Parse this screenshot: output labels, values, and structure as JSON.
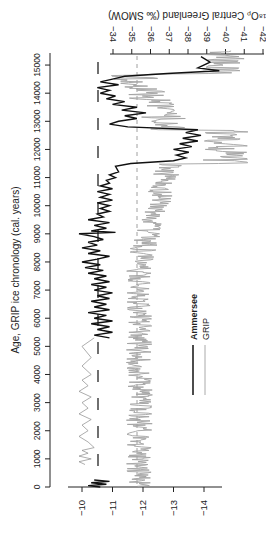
{
  "chart_data": {
    "type": "line",
    "orientation": "rotated-90",
    "title": "",
    "ylabel_age": "Age, GRIP ice chronology (cal. years)",
    "xlabel_bottom": "",
    "xlabel_top": "δ18Op Central Greenland (‰ SMOW)",
    "age_ticks": [
      0,
      1000,
      2000,
      3000,
      4000,
      5000,
      6000,
      7000,
      8000,
      9000,
      10000,
      11000,
      12000,
      13000,
      14000,
      15000
    ],
    "age_tick_labels": [
      "0",
      "1000",
      "2000",
      "3000",
      "4000",
      "5000",
      "6000",
      "7000",
      "8000",
      "9000",
      "10000",
      "11000",
      "12000",
      "13000",
      "14000",
      "15000"
    ],
    "bottom_ticks": [
      -10,
      -11,
      -12,
      -13,
      -14
    ],
    "bottom_tick_labels": [
      "−10",
      "−11",
      "−12",
      "−13",
      "−14"
    ],
    "top_ticks": [
      -34,
      -35,
      -36,
      -37,
      -38,
      -39,
      -40,
      -41,
      -42
    ],
    "top_tick_labels": [
      "−34",
      "−35",
      "−36",
      "−37",
      "−38",
      "−39",
      "−40",
      "−41",
      "−42"
    ],
    "age_range": [
      0,
      15500
    ],
    "bottom_range": [
      -9.6,
      -14.6
    ],
    "top_range": [
      -34,
      -42
    ],
    "legend": [
      {
        "name": "Ammersee",
        "color": "#111111",
        "width": 2
      },
      {
        "name": "GRIP",
        "color": "#999999",
        "width": 1
      }
    ],
    "reference_lines": [
      {
        "axis": "bottom",
        "value": -10.5,
        "style": "long-dash",
        "color": "#111111"
      },
      {
        "axis": "top",
        "value": -35.2,
        "style": "short-dash",
        "color": "#999999"
      }
    ],
    "series": [
      {
        "name": "Ammersee",
        "axis": "bottom",
        "color": "#111111",
        "points": [
          [
            0,
            -10.6
          ],
          [
            50,
            -10.2
          ],
          [
            100,
            -10.8
          ],
          [
            150,
            -10.3
          ],
          [
            200,
            -10.9
          ],
          [
            250,
            -10.4
          ],
          [
            5300,
            -10.9
          ],
          [
            5400,
            -10.4
          ],
          [
            5500,
            -11.0
          ],
          [
            5600,
            -10.5
          ],
          [
            5700,
            -10.9
          ],
          [
            5800,
            -10.3
          ],
          [
            5900,
            -11.0
          ],
          [
            6000,
            -10.4
          ],
          [
            6100,
            -10.8
          ],
          [
            6200,
            -10.2
          ],
          [
            6300,
            -10.9
          ],
          [
            6400,
            -10.4
          ],
          [
            6500,
            -10.8
          ],
          [
            6600,
            -10.3
          ],
          [
            6700,
            -10.9
          ],
          [
            6800,
            -10.5
          ],
          [
            6900,
            -11.0
          ],
          [
            7000,
            -10.4
          ],
          [
            7100,
            -10.8
          ],
          [
            7200,
            -10.3
          ],
          [
            7300,
            -10.9
          ],
          [
            7400,
            -10.4
          ],
          [
            7500,
            -10.8
          ],
          [
            7600,
            -10.2
          ],
          [
            7700,
            -10.7
          ],
          [
            7800,
            -10.1
          ],
          [
            7900,
            -10.6
          ],
          [
            8000,
            -10.0
          ],
          [
            8100,
            -10.5
          ],
          [
            8200,
            -10.9
          ],
          [
            8300,
            -10.2
          ],
          [
            8400,
            -10.6
          ],
          [
            8500,
            -10.0
          ],
          [
            8600,
            -10.5
          ],
          [
            8700,
            -10.2
          ],
          [
            8800,
            -10.7
          ],
          [
            8900,
            -10.4
          ],
          [
            9000,
            -9.9
          ],
          [
            9050,
            -11.1
          ],
          [
            9100,
            -10.3
          ],
          [
            9200,
            -10.8
          ],
          [
            9300,
            -10.4
          ],
          [
            9400,
            -10.9
          ],
          [
            9500,
            -10.2
          ],
          [
            9600,
            -10.7
          ],
          [
            9700,
            -10.5
          ],
          [
            9800,
            -10.9
          ],
          [
            9900,
            -10.6
          ],
          [
            10000,
            -10.9
          ],
          [
            10100,
            -10.5
          ],
          [
            10200,
            -11.0
          ],
          [
            10300,
            -10.6
          ],
          [
            10400,
            -10.9
          ],
          [
            10500,
            -10.5
          ],
          [
            10600,
            -11.0
          ],
          [
            10700,
            -10.6
          ],
          [
            10800,
            -10.9
          ],
          [
            10900,
            -10.8
          ],
          [
            11000,
            -11.1
          ],
          [
            11100,
            -10.9
          ],
          [
            11200,
            -11.2
          ],
          [
            11400,
            -11.1
          ],
          [
            11500,
            -11.6
          ],
          [
            11600,
            -13.0
          ],
          [
            11700,
            -13.4
          ],
          [
            11800,
            -13.1
          ],
          [
            11900,
            -13.5
          ],
          [
            12000,
            -13.0
          ],
          [
            12100,
            -13.6
          ],
          [
            12200,
            -13.2
          ],
          [
            12300,
            -13.8
          ],
          [
            12400,
            -13.3
          ],
          [
            12500,
            -13.9
          ],
          [
            12600,
            -13.4
          ],
          [
            12700,
            -13.8
          ],
          [
            12800,
            -11.5
          ],
          [
            12900,
            -10.9
          ],
          [
            13000,
            -11.2
          ],
          [
            13100,
            -11.8
          ],
          [
            13200,
            -11.4
          ],
          [
            13300,
            -12.1
          ],
          [
            13400,
            -11.3
          ],
          [
            13500,
            -11.8
          ],
          [
            13600,
            -11.0
          ],
          [
            13700,
            -11.4
          ],
          [
            13800,
            -10.8
          ],
          [
            13900,
            -11.1
          ],
          [
            14000,
            -10.6
          ],
          [
            14100,
            -10.9
          ],
          [
            14200,
            -10.5
          ],
          [
            14300,
            -11.2
          ],
          [
            14400,
            -10.6
          ],
          [
            14500,
            -11.0
          ],
          [
            14600,
            -11.4
          ],
          [
            14700,
            -12.8
          ],
          [
            14800,
            -14.5
          ],
          [
            14900,
            -13.8
          ],
          [
            15100,
            -14.2
          ],
          [
            15300,
            -13.9
          ]
        ]
      },
      {
        "name": "Ammersee (low-res)",
        "axis": "bottom",
        "color": "#888888",
        "points": [
          [
            800,
            -10.1
          ],
          [
            900,
            -9.9
          ],
          [
            1000,
            -10.3
          ],
          [
            1100,
            -9.9
          ],
          [
            1200,
            -10.2
          ],
          [
            1300,
            -10.0
          ],
          [
            1400,
            -10.4
          ],
          [
            1600,
            -10.2
          ],
          [
            1800,
            -9.9
          ],
          [
            2000,
            -10.2
          ],
          [
            2200,
            -10.0
          ],
          [
            2400,
            -10.3
          ],
          [
            2600,
            -9.9
          ],
          [
            2800,
            -10.2
          ],
          [
            3000,
            -10.0
          ],
          [
            3200,
            -10.3
          ],
          [
            3400,
            -9.9
          ],
          [
            3600,
            -10.2
          ],
          [
            3800,
            -10.0
          ],
          [
            4000,
            -10.3
          ],
          [
            4300,
            -10.0
          ],
          [
            4600,
            -10.3
          ],
          [
            5000,
            -10.0
          ],
          [
            5300,
            -10.4
          ]
        ]
      },
      {
        "name": "GRIP",
        "axis": "top",
        "color": "#a0a0a0",
        "points": []
      }
    ]
  },
  "labels": {
    "age_axis_title": "Age, GRIP ice chronology (cal. years)",
    "top_axis_title": "δ¹⁸Oₚ Central Greenland (‰ SMOW)",
    "legend_ammersee": "Ammersee",
    "legend_grip": "GRIP"
  }
}
